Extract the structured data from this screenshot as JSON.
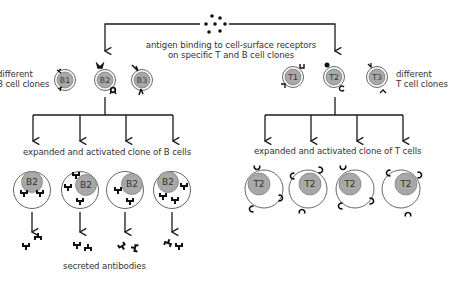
{
  "diagram": {
    "title_caption": [
      "antigen binding to cell-surface receptors",
      "on specific T and B cell clones"
    ],
    "left_label": [
      "different",
      "B cell clones"
    ],
    "right_label": [
      "different",
      "T cell clones"
    ],
    "b_cells": [
      "B1",
      "B2",
      "B3"
    ],
    "t_cells": [
      "T1",
      "T2",
      "T3"
    ],
    "b_clone_caption": "expanded and activated clone of B cells",
    "t_clone_caption": "expanded and activated clone of T cells",
    "b_clone_cells": [
      "B2",
      "B2",
      "B2",
      "B2"
    ],
    "t_clone_cells": [
      "T2",
      "T2",
      "T2",
      "T2"
    ],
    "antibody_caption": "secreted antibodies",
    "colors": {
      "line": "#1a1a1a",
      "nucleus": "#a8a8a8",
      "nucleus_border": "#777777",
      "cell_border": "#555555",
      "text": "#333333",
      "background": "#ffffff"
    }
  }
}
